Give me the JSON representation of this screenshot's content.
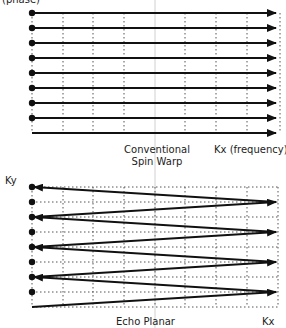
{
  "top_panel": {
    "y_axis_label": "(phase)",
    "title_line1": "Conventional",
    "title_line2": "Spin Warp",
    "x_axis_label": "Kx (frequency)",
    "rows_y": [
      13,
      28,
      43,
      58,
      73,
      88,
      103,
      118,
      133
    ],
    "dot_rows": 8,
    "x_start": 32,
    "x_end": 280,
    "grid_x": [
      32,
      63,
      93,
      124,
      185,
      216,
      247,
      280
    ]
  },
  "bottom_panel": {
    "y_axis_label": "Ky",
    "title": "Echo Planar",
    "x_axis_label": "Kx",
    "rows_y": [
      187,
      202,
      217,
      232,
      247,
      262,
      277,
      292
    ],
    "bottom_start_y": 307,
    "x_start": 32,
    "x_end": 278,
    "grid_x": [
      32,
      63,
      93,
      124,
      155,
      185,
      216,
      247,
      278
    ]
  },
  "colors": {
    "line": "#111111",
    "grid": "#555555",
    "divider": "#cccccc"
  }
}
